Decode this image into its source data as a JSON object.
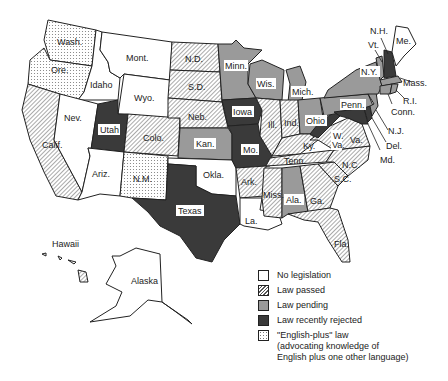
{
  "legend": {
    "items": [
      {
        "key": "none",
        "label": "No legislation"
      },
      {
        "key": "passed",
        "label": "Law passed"
      },
      {
        "key": "pending",
        "label": "Law pending"
      },
      {
        "key": "rejected",
        "label": "Law recently rejected"
      },
      {
        "key": "plus",
        "label": "\"English-plus\" law\n(advocating knowledge of\nEnglish plus one other language)"
      }
    ]
  },
  "colors": {
    "none": "#ffffff",
    "passed_hatch": "#555555",
    "pending": "#9a9a9a",
    "rejected": "#3a3a3a",
    "plus_dot": "#777777",
    "outline": "#222222"
  },
  "states": {
    "wash": {
      "label": "Wash.",
      "status": "plus"
    },
    "ore": {
      "label": "Ore.",
      "status": "plus"
    },
    "calif": {
      "label": "Calif.",
      "status": "passed"
    },
    "idaho": {
      "label": "Idaho",
      "status": "none"
    },
    "nev": {
      "label": "Nev.",
      "status": "none"
    },
    "mont": {
      "label": "Mont.",
      "status": "none"
    },
    "wyo": {
      "label": "Wyo.",
      "status": "none"
    },
    "utah": {
      "label": "Utah",
      "status": "rejected"
    },
    "ariz": {
      "label": "Ariz.",
      "status": "none"
    },
    "colo": {
      "label": "Colo.",
      "status": "passed"
    },
    "nm": {
      "label": "N.M.",
      "status": "plus"
    },
    "nd": {
      "label": "N.D.",
      "status": "passed"
    },
    "sd": {
      "label": "S.D.",
      "status": "passed"
    },
    "neb": {
      "label": "Neb.",
      "status": "passed"
    },
    "kan": {
      "label": "Kan.",
      "status": "pending"
    },
    "okla": {
      "label": "Okla.",
      "status": "none"
    },
    "texas": {
      "label": "Texas",
      "status": "rejected"
    },
    "minn": {
      "label": "Minn.",
      "status": "pending"
    },
    "iowa": {
      "label": "Iowa",
      "status": "rejected"
    },
    "mo": {
      "label": "Mo.",
      "status": "rejected"
    },
    "ark": {
      "label": "Ark.",
      "status": "passed"
    },
    "la": {
      "label": "La.",
      "status": "none"
    },
    "wis": {
      "label": "Wis.",
      "status": "pending"
    },
    "ill": {
      "label": "Ill.",
      "status": "passed"
    },
    "mich": {
      "label": "Mich.",
      "status": "pending"
    },
    "ind": {
      "label": "Ind.",
      "status": "passed"
    },
    "ohio": {
      "label": "Ohio",
      "status": "pending"
    },
    "ky": {
      "label": "Ky.",
      "status": "passed"
    },
    "tenn": {
      "label": "Tenn.",
      "status": "passed"
    },
    "miss": {
      "label": "Miss.",
      "status": "passed"
    },
    "ala": {
      "label": "Ala.",
      "status": "pending"
    },
    "ga": {
      "label": "Ga.",
      "status": "passed"
    },
    "fla": {
      "label": "Fla.",
      "status": "passed"
    },
    "sc": {
      "label": "S.C.",
      "status": "passed"
    },
    "nc": {
      "label": "N.C.",
      "status": "passed"
    },
    "va": {
      "label": "Va.",
      "status": "passed"
    },
    "wva": {
      "label": "W. Va.",
      "label_line1": "W.",
      "label_line2": "Va.",
      "status": "rejected"
    },
    "penn": {
      "label": "Penn.",
      "status": "pending"
    },
    "ny": {
      "label": "N.Y.",
      "status": "pending"
    },
    "vt": {
      "label": "Vt.",
      "status": "pending"
    },
    "nh": {
      "label": "N.H.",
      "status": "rejected"
    },
    "me": {
      "label": "Me.",
      "status": "none"
    },
    "mass": {
      "label": "Mass.",
      "status": "pending"
    },
    "ri": {
      "label": "R.I.",
      "status": "pending"
    },
    "conn": {
      "label": "Conn.",
      "status": "pending"
    },
    "nj": {
      "label": "N.J.",
      "status": "pending"
    },
    "del": {
      "label": "Del.",
      "status": "rejected"
    },
    "md": {
      "label": "Md.",
      "status": "rejected"
    },
    "hawaii": {
      "label": "Hawaii",
      "status": "passed"
    },
    "alaska": {
      "label": "Alaska",
      "status": "none"
    }
  }
}
